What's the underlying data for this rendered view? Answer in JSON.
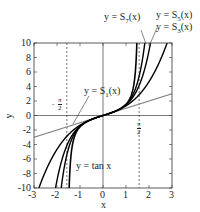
{
  "chart_data": {
    "type": "line",
    "title": "",
    "xlabel": "x",
    "ylabel": "y",
    "xlim": [
      -3,
      3
    ],
    "ylim": [
      -10,
      10
    ],
    "xticks": [
      "-3",
      "-2",
      "-1",
      "0",
      "1",
      "2",
      "3"
    ],
    "yticks": [
      "10",
      "8",
      "6",
      "4",
      "2",
      "0",
      "-2",
      "-4",
      "-6",
      "-8",
      "-10"
    ],
    "grid": false,
    "series": [
      {
        "name": "y = tan x",
        "color": "#000000",
        "formula": "tan(x)"
      },
      {
        "name": "y = S1(x)",
        "color": "#888888",
        "formula": "x"
      },
      {
        "name": "y = S3(x)",
        "color": "#000000",
        "formula": "x + x^3/3"
      },
      {
        "name": "y = S5(x)",
        "color": "#000000",
        "formula": "x + x^3/3 + 2x^5/15"
      },
      {
        "name": "y = S7(x)",
        "color": "#000000",
        "formula": "x + x^3/3 + 2x^5/15 + 17x^7/315"
      }
    ],
    "annotations": [
      {
        "text": "y = S7(x)",
        "points_to": "S7"
      },
      {
        "text": "y = S5(x)",
        "points_to": "S5"
      },
      {
        "text": "y = S3(x)",
        "points_to": "S3"
      },
      {
        "text": "y = S1(x)",
        "points_to": "S1"
      },
      {
        "text": "y = tan x",
        "points_to": "tan"
      },
      {
        "text": "-π/2",
        "type": "vertical-asymptote",
        "x": -1.5708
      },
      {
        "text": "π/2",
        "type": "vertical-asymptote",
        "x": 1.5708
      }
    ]
  },
  "labels": {
    "s7": "y = S",
    "s7_sub": "7",
    "s5": "y = S",
    "s5_sub": "5",
    "s3": "y = S",
    "s3_sub": "3",
    "s1": "y = S",
    "s1_sub": "1",
    "suffix": "(x)",
    "tan": "y = tan x",
    "neg_pi_num": "π",
    "neg_pi_den": "2",
    "neg_sign": "-",
    "pi_num": "π",
    "pi_den": "2"
  },
  "axis": {
    "xlabel": "x",
    "ylabel": "y",
    "xticks": [
      "-3",
      "-2",
      "-1",
      "0",
      "1",
      "2",
      "3"
    ],
    "yticks": [
      "10",
      "8",
      "6",
      "4",
      "2",
      "0",
      "-2",
      "-4",
      "-6",
      "-8",
      "-10"
    ]
  }
}
